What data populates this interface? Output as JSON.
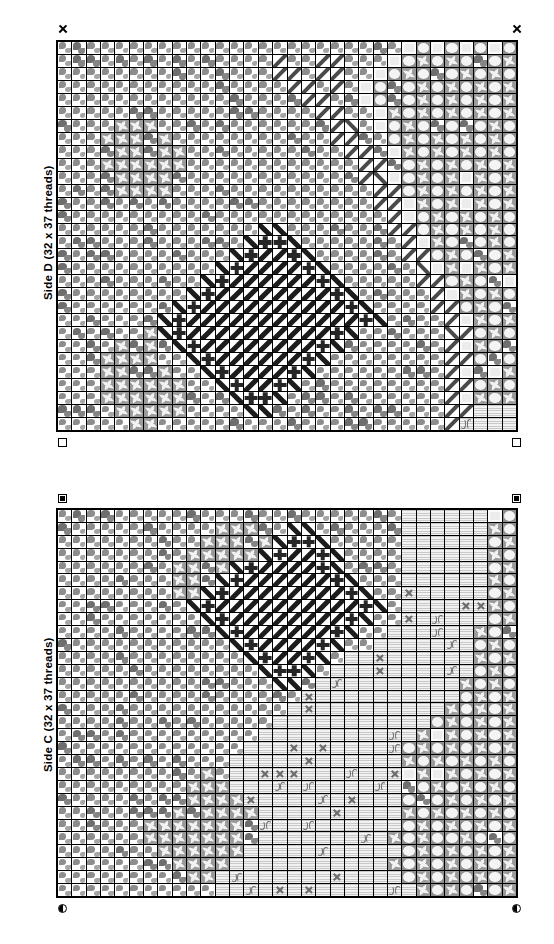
{
  "document": {
    "kind": "needlepoint-chart",
    "background_color": "#ffffff",
    "ink_color": "#000000"
  },
  "panels": [
    {
      "id": "side-d",
      "label": "Side D (32 x 37 threads)",
      "side_letter": "D",
      "columns": 32,
      "rows": 30,
      "thread_count_text": "32 x 37 threads",
      "corner_markers": {
        "top_left": "cross",
        "top_right": "cross",
        "bottom_left": "square",
        "bottom_right": "square"
      }
    },
    {
      "id": "side-c",
      "label": "Side C (32 x 37 threads)",
      "side_letter": "C",
      "columns": 32,
      "rows": 30,
      "thread_count_text": "32 x 37 threads",
      "corner_markers": {
        "top_left": "square-dot",
        "top_right": "square-dot",
        "bottom_left": "half-circle",
        "bottom_right": "half-circle"
      }
    }
  ],
  "symbol_key": {
    "blob": "grey quarter-blob field stitch",
    "blobd": "dark grey quarter-blob field stitch",
    "star": "grey star burst stitch",
    "disc": "light disc on grey ground",
    "slash": "diagonal backstitch (forward)",
    "bslash": "diagonal backstitch (backward)",
    "slashd": "heavy diagonal backstitch (forward)",
    "bslashd": "heavy diagonal backstitch (backward)",
    "cross": "dark upright cross stitch",
    "knot": "dark knot stitch",
    "stripe": "pale horizontal striped ground",
    "stripex": "pale striped ground with x mark",
    "stripepc": "pale striped ground with double-arc mark",
    "light": "plain light cell",
    "blank": "empty canvas"
  },
  "chart_data": {
    "type": "heatmap",
    "xlabel": "",
    "ylabel": "",
    "grid": true,
    "legend": "none",
    "cell_symbols": [
      "blank",
      "blob",
      "blobd",
      "star",
      "disc",
      "slash",
      "bslash",
      "slashd",
      "bslashd",
      "cross",
      "knot",
      "stripe",
      "stripex",
      "stripepc",
      "light"
    ],
    "side_d_rows": [
      "bbbbbbbbbbbbbbbbbbbbbbbbLDLDLDLD",
      "bbbbbbbbbbbbbbb/bb//bbbLDsDsDsDs",
      "bbbbbbbbbbbbbbb//b//bbLDsDsDsDsD",
      "bbbbbbbbbbbbbbbb//b/bLDsDsDsDsDs",
      "bbbbbbbbbbbbbbbbb//bbLDsDsDsDsDs",
      "bbbbbbsbbbbbbbbbbb//bbLsDsDsDsDs",
      "bbbbsssbbbbbbbbbbbb//bLDsDsDsDsD",
      "bbbsssssbbbbbbbbbbb//bbDsDsDsDsD",
      "bbbssssssbbbbbbbbbbb//bLsDsDsDsD",
      "bbbssssssbbbbbbbbbbbb//bDsDsDsDs",
      "bbbssssssbbbbbbbbbbbb//LDsDsDsDs",
      "bbbbssssbbbbbbbbbbbbbb//DsDsDsDs",
      "bbbbbsbbbbbbbbbbbbbbbb//LsDsDsDs",
      "bbbbbbbbbbbbbbbbbbbbbbb/LDsDsDsD",
      "bbbbbbbbbbbbbbccbbbbbbb//DsDsDsD",
      "bbbbbbbbbbbbbc++cbbbbbbb/LsDsDsD",
      "bbbbbbbbbbbbc+##+cbbbbbb//DsDsDs",
      "bbbbbbbbbbbc+####+cbbbbbb/LsDsDs",
      "bbbbbbbbbbc+######+cbbbbb//DsDsD",
      "bbbbbbbbbc+########+cbbbbb/LsDsD",
      "bbbbbbbbc+##########+cbbbb//DsDs",
      "bbbbbbbc+############+cbbbb/LsDs",
      "bbbbbbsc+##########+cbbbbbb//DsD",
      "bbbbsssbc+########+cbbbbbbb/LsDs",
      "bbbssssbbc+######+cbbbbbbbb//DsD",
      "bbbsssssbbc+####+cbbbbbbbbb/LsDs",
      "bbbssssssbbc+##+cbbbbbbbbbb//DsD",
      "bbbssssssbbbc++cbbbbbbbbbbb/LsDs",
      "bbbbsssssbbbbccbbbbbbbbbbbb//ttt",
      "bbbbbssbbbbbbbbbbbbbbbbbbbb/tttt"
    ],
    "side_c_rows": [
      "bbbbbbbbbbbbbbbbbbbbbbbbttttttLD",
      "bbbbbbbbbbbsssbbccbbbbbbttttttsDs",
      "bbbbbbbbbbsssssc++cbbbbbttttttDsD",
      "bbbbbbbbbsssssc+##+cbbbbttttttsDs",
      "bbbbbbbbssssc+####+cbbbbttttttDsD",
      "bbbbbbbbsssc+######+cbbbttttttsDs",
      "bbbbbbbbssc+########+cbbttttttDsD",
      "bbbbbbbbbc+##########+cbttttttsDs",
      "bbbbbbbbbbc+########+cbbttttttDsD",
      "bbbbbbbbbbbc+######+cbbttttttsDsD",
      "bbbbbbbbbbbbc+####+cbbtttttttDsDs",
      "bbbbbbbbbbbbbc+##+cbtttttttttsDsD",
      "bbbbbbbbbbbbbbc++cbttttttttttDsDs",
      "bbbbbbbbbbbbbbbccbttttttttttsDsDs",
      "bbbbbbbbbbbbbbbbbtttttttttttDsDsD",
      "bbbbbbbbbbbbbbbbtttttttttttsDsDsD",
      "bbbbbbbbbbbbbbbtttttttttttDsDsDsD",
      "bbbbbbbbbbbbbbtttttttttttsDsDsDsD",
      "bbbbbbbbbbbbbtttttttttttDsDsDsDsD",
      "bbbbbbbbbbbbttttttttttttsDsDsDsDs",
      "bbbbbbbbbbsbttttttttttttDsDsDsDsD",
      "bbbbbbbbbsssttttttttttttsDsDsDsDs",
      "bbbbbbbbssssstttttttttttDsDsDsDsD",
      "bbbbbbbsssssssttttttttttsDsDsDsDs",
      "bbbbbbssssssssttttttttttDsDsDsDsD",
      "bbbbbbsssssssstttttttttsDsDDsDsDs",
      "bbbbbbbsssssstttttttttttDsDsDsDsD",
      "bbbbbbbbsssstttttttttttsDsDsDsDsD",
      "bbbbbbbbbsstttttttttttttDsDsDsDsD",
      "bbbbbbbbbbbttttttttttttttsDsDsDsD"
    ]
  }
}
